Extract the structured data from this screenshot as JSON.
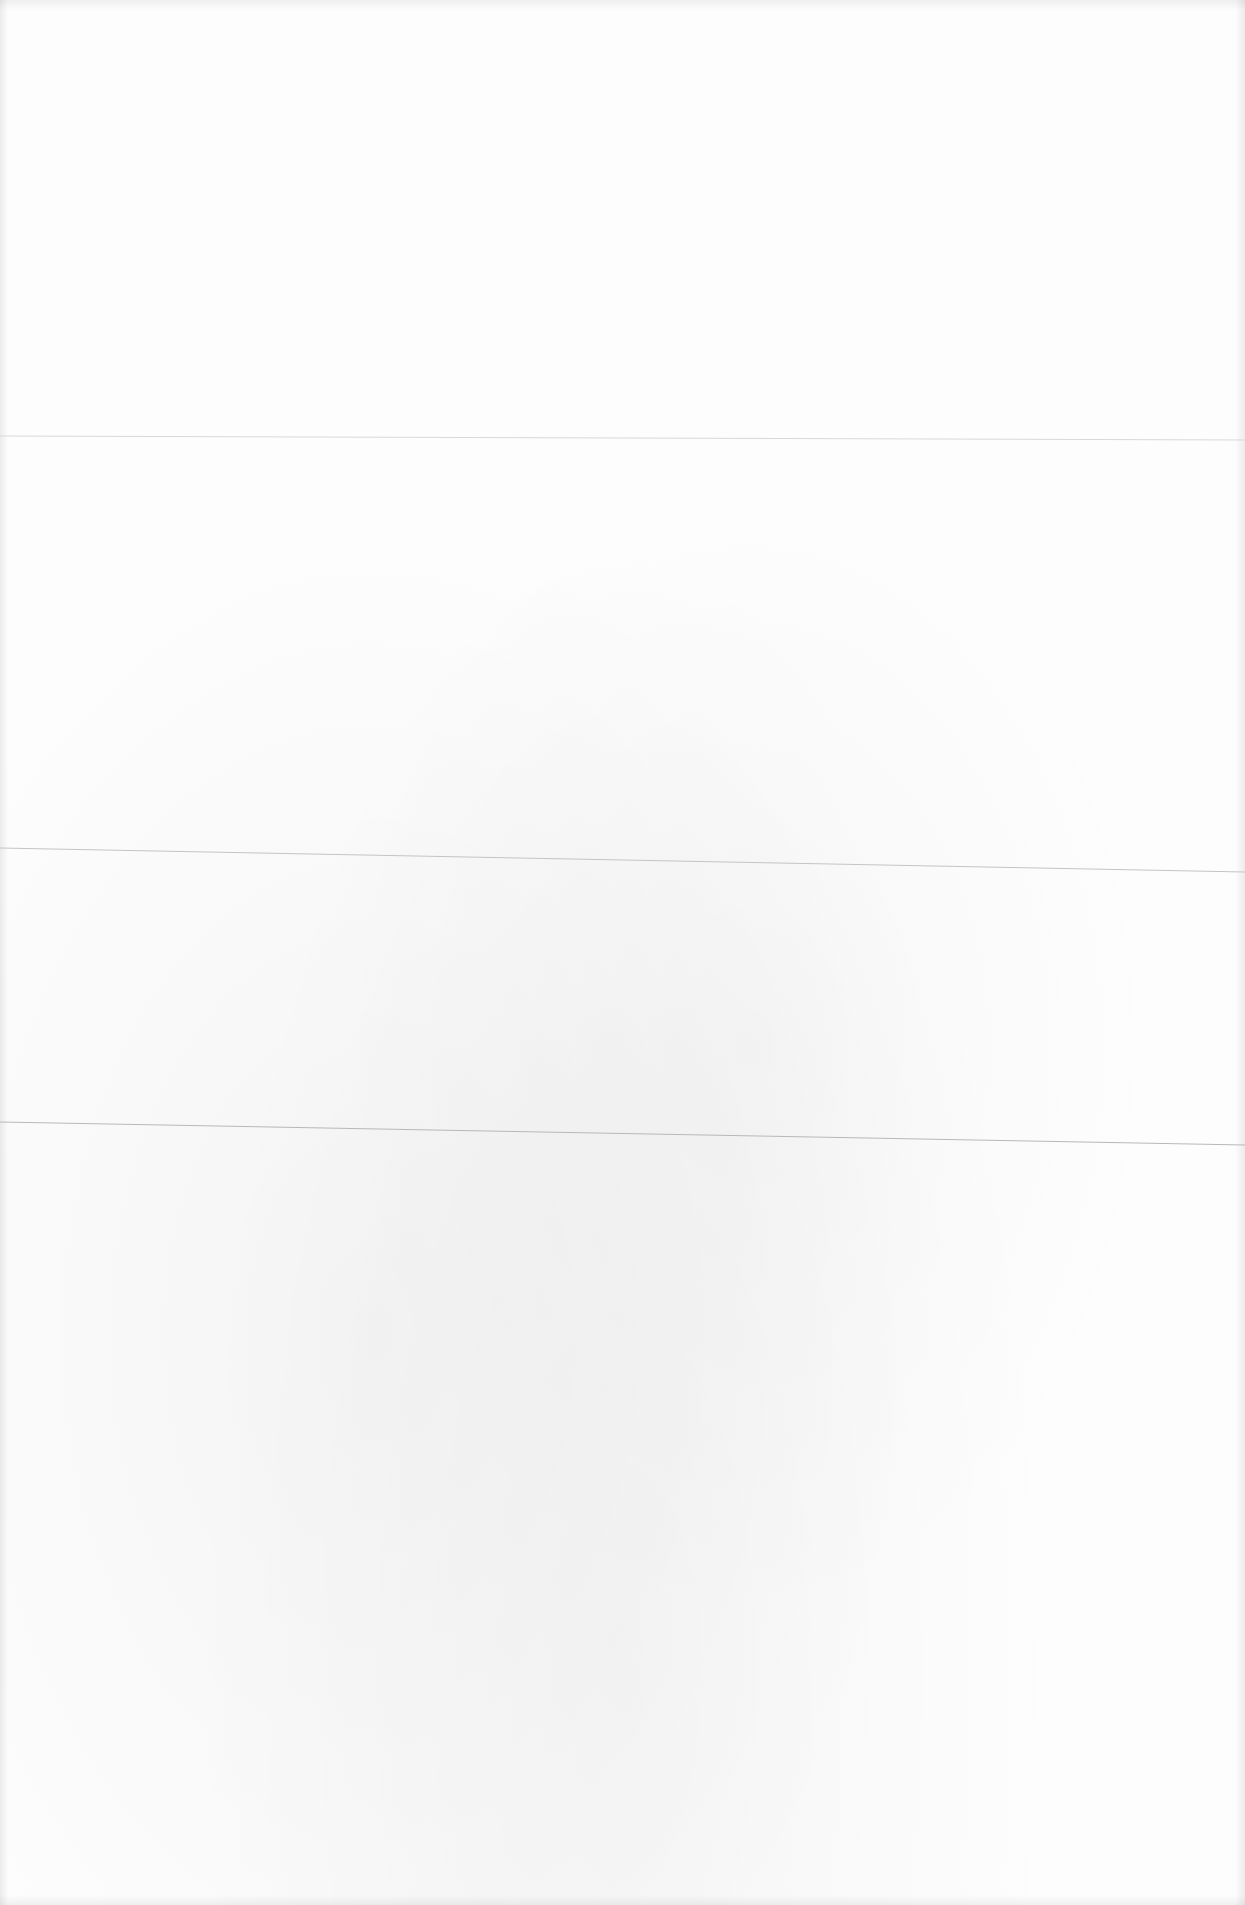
{
  "page": {
    "type": "blank scanned page",
    "background_color": "#fdfdfd",
    "text_content": ""
  },
  "rules": [
    {
      "id": "faint-line-1",
      "x1": 0,
      "y1": 436,
      "x2": 1245,
      "y2": 440,
      "color": "#d8d8d8",
      "width": 1
    },
    {
      "id": "rule-line-1",
      "x1": 0,
      "y1": 848,
      "x2": 1245,
      "y2": 872,
      "color": "#c4c4c4",
      "width": 1
    },
    {
      "id": "rule-line-2",
      "x1": 0,
      "y1": 1122,
      "x2": 1245,
      "y2": 1145,
      "color": "#b8b8b8",
      "width": 1
    }
  ]
}
